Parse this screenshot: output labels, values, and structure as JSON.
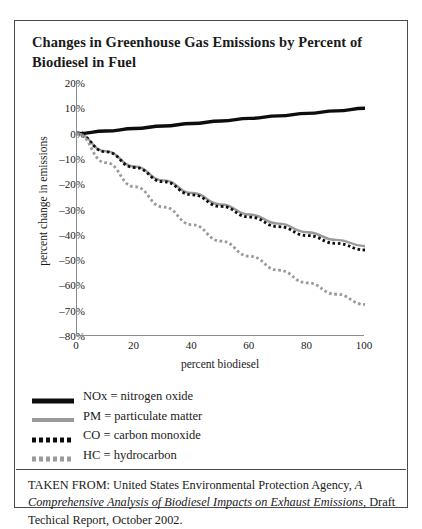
{
  "title": "Changes in Greenhouse Gas Emissions by Percent of Biodiesel in Fuel",
  "caption": {
    "prefix": "TAKEN FROM: United States Environmental Protection Agency,",
    "italic": "A Comprehensive Analysis of Biodiesel Impacts on Exhaust Emissions",
    "suffix": ", Draft Techical Report, October 2002."
  },
  "legend": [
    {
      "label": "NOx = nitrogen oxide",
      "style": "solid-thick",
      "color": "#0d0d0d"
    },
    {
      "label": "PM = particulate matter",
      "style": "solid",
      "color": "#9a9a9a"
    },
    {
      "label": "CO = carbon monoxide",
      "style": "dotted-square",
      "color": "#0d0d0d"
    },
    {
      "label": "HC = hydrocarbon",
      "style": "dotted-square",
      "color": "#9a9a9a"
    }
  ],
  "chart_data": {
    "type": "line",
    "title": "Changes in Greenhouse Gas Emissions by Percent of Biodiesel in Fuel",
    "xlabel": "percent biodiesel",
    "ylabel": "percent change in emissions",
    "xlim": [
      0,
      100
    ],
    "ylim": [
      -80,
      20
    ],
    "xticks": [
      0,
      20,
      40,
      60,
      80,
      100
    ],
    "yticks": [
      "20%",
      "10%",
      "0%",
      "-10%",
      "-20%",
      "-30%",
      "-40%",
      "-50%",
      "-60%",
      "-70%",
      "-80%"
    ],
    "ytick_values": [
      20,
      10,
      0,
      -10,
      -20,
      -30,
      -40,
      -50,
      -60,
      -70,
      -80
    ],
    "grid": false,
    "legend_position": "below-plot",
    "x": [
      0,
      10,
      20,
      30,
      40,
      50,
      60,
      70,
      80,
      90,
      100
    ],
    "series": [
      {
        "name": "NOx = nitrogen oxide",
        "color": "#0d0d0d",
        "style": "solid-thick",
        "values": [
          0,
          1.0,
          2.0,
          3.0,
          4.0,
          5.0,
          6.0,
          7.0,
          8.0,
          9.0,
          10.0
        ]
      },
      {
        "name": "PM = particulate matter",
        "color": "#9a9a9a",
        "style": "solid",
        "values": [
          0,
          -7.0,
          -13.0,
          -18.5,
          -23.5,
          -28.0,
          -32.0,
          -35.6,
          -39.0,
          -42.0,
          -44.5
        ]
      },
      {
        "name": "CO = carbon monoxide",
        "color": "#0d0d0d",
        "style": "dotted-square",
        "values": [
          0,
          -7.2,
          -13.4,
          -19.0,
          -24.2,
          -28.8,
          -33.0,
          -36.8,
          -40.3,
          -43.4,
          -46.0
        ]
      },
      {
        "name": "HC = hydrocarbon",
        "color": "#9a9a9a",
        "style": "dotted-square",
        "values": [
          0,
          -11.5,
          -21.0,
          -29.0,
          -36.0,
          -42.5,
          -48.5,
          -54.0,
          -59.0,
          -63.5,
          -67.5
        ]
      }
    ]
  }
}
